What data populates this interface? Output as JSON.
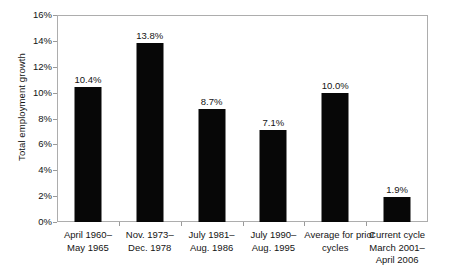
{
  "chart_data": {
    "type": "bar",
    "title": "",
    "subtitle": "",
    "xlabel": "",
    "ylabel": "Total employment growth",
    "ylim": [
      0,
      16
    ],
    "yticks": [
      "0%",
      "2%",
      "4%",
      "6%",
      "8%",
      "10%",
      "12%",
      "14%",
      "16%"
    ],
    "ytick_values": [
      0,
      2,
      4,
      6,
      8,
      10,
      12,
      14,
      16
    ],
    "grid": false,
    "legend": false,
    "bar_color": "#070707",
    "axis_color": "#adadad",
    "text_color": "#141414",
    "categories": [
      "April 1960–\nMay 1965",
      "Nov. 1973–\nDec. 1978",
      "July 1981–\nAug. 1986",
      "July 1990–\nAug. 1995",
      "Average for prior\ncycles",
      "Current cycle\nMarch 2001–\nApril 2006"
    ],
    "category_lines": [
      [
        "April 1960–",
        "May 1965"
      ],
      [
        "Nov. 1973–",
        "Dec. 1978"
      ],
      [
        "July 1981–",
        "Aug. 1986"
      ],
      [
        "July 1990–",
        "Aug. 1995"
      ],
      [
        "Average for prior",
        "cycles"
      ],
      [
        "Current cycle",
        "March 2001–",
        "April 2006"
      ]
    ],
    "values": [
      10.4,
      13.8,
      8.7,
      7.1,
      10.0,
      1.9
    ],
    "value_labels": [
      "10.4%",
      "13.8%",
      "8.7%",
      "7.1%",
      "10.0%",
      "1.9%"
    ]
  }
}
